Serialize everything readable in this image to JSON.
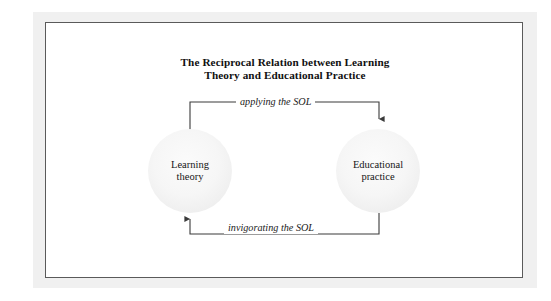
{
  "figure": {
    "title_line_1": "The Reciprocal Relation between Learning",
    "title_line_2": "Theory and Educational Practice",
    "border_color": "#5a5a5a",
    "background_color": "#ffffff",
    "node_fill_color": "#f1f1f1",
    "line_color": "#3a3a3a"
  },
  "nodes": [
    {
      "id": "learning-theory",
      "label_line_1": "Learning",
      "label_line_2": "theory",
      "shape": "circle"
    },
    {
      "id": "educational-practice",
      "label_line_1": "Educational",
      "label_line_2": "practice",
      "shape": "circle"
    }
  ],
  "edges": [
    {
      "id": "applying",
      "label": "applying the SOL",
      "from": "learning-theory",
      "to": "educational-practice",
      "direction": "right",
      "arrowhead": "down-into-educational-practice"
    },
    {
      "id": "invigorating",
      "label": "invigorating the SOL",
      "from": "educational-practice",
      "to": "learning-theory",
      "direction": "left",
      "arrowhead": "up-into-learning-theory"
    }
  ]
}
